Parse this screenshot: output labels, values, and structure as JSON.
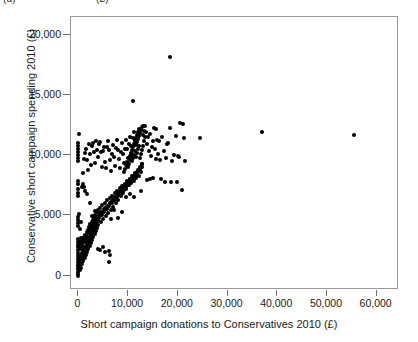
{
  "caption_fragment": {
    "part_a": "(a)",
    "part_b": "(£)"
  },
  "chart_data": {
    "type": "scatter",
    "title": "",
    "subtitle": "",
    "xlabel": "Short campaign donations to Conservatives 2010 (£)",
    "ylabel": "Conservative short campaign spending 2010 (£)",
    "xlim": [
      -1500,
      64500
    ],
    "ylim": [
      -1200,
      21500
    ],
    "xticks": [
      0,
      10000,
      20000,
      30000,
      40000,
      50000,
      60000
    ],
    "xticklabels": [
      "0",
      "10,000",
      "20,000",
      "30,000",
      "40,000",
      "50,000",
      "60,000"
    ],
    "yticks": [
      0,
      5000,
      10000,
      15000,
      20000
    ],
    "yticklabels": [
      "0",
      "5,000",
      "10,000",
      "15,000",
      "20,000"
    ],
    "grid": false,
    "legend": null,
    "marker": {
      "shape": "circle",
      "color": "#000000",
      "size_px": 4
    },
    "frame_color": "#9a9a9a",
    "n_points": 318,
    "points": [
      [
        0,
        0
      ],
      [
        0,
        120
      ],
      [
        0,
        330
      ],
      [
        0,
        520
      ],
      [
        0,
        700
      ],
      [
        0,
        900
      ],
      [
        0,
        1100
      ],
      [
        0,
        1350
      ],
      [
        0,
        1600
      ],
      [
        0,
        1850
      ],
      [
        0,
        2100
      ],
      [
        0,
        2350
      ],
      [
        0,
        2550
      ],
      [
        0,
        2800
      ],
      [
        0,
        3050
      ],
      [
        0,
        4100
      ],
      [
        0,
        4350
      ],
      [
        0,
        4600
      ],
      [
        0,
        4900
      ],
      [
        0,
        6650
      ],
      [
        0,
        6900
      ],
      [
        0,
        7200
      ],
      [
        0,
        7600
      ],
      [
        0,
        7900
      ],
      [
        0,
        9550
      ],
      [
        0,
        9800
      ],
      [
        0,
        10050
      ],
      [
        0,
        10300
      ],
      [
        0,
        10550
      ],
      [
        0,
        10800
      ],
      [
        0,
        11050
      ],
      [
        200,
        11750
      ],
      [
        150,
        2450
      ],
      [
        180,
        1250
      ],
      [
        220,
        620
      ],
      [
        250,
        2700
      ],
      [
        300,
        450
      ],
      [
        330,
        1500
      ],
      [
        360,
        900
      ],
      [
        400,
        2200
      ],
      [
        430,
        1750
      ],
      [
        460,
        3100
      ],
      [
        500,
        1000
      ],
      [
        530,
        2900
      ],
      [
        560,
        640
      ],
      [
        600,
        1400
      ],
      [
        640,
        2350
      ],
      [
        680,
        1850
      ],
      [
        720,
        980
      ],
      [
        760,
        2600
      ],
      [
        800,
        1500
      ],
      [
        840,
        3000
      ],
      [
        880,
        2050
      ],
      [
        920,
        1200
      ],
      [
        960,
        2750
      ],
      [
        1000,
        1600
      ],
      [
        1050,
        2400
      ],
      [
        1100,
        1850
      ],
      [
        1150,
        3200
      ],
      [
        1200,
        2250
      ],
      [
        1250,
        1450
      ],
      [
        1300,
        2800
      ],
      [
        1350,
        2000
      ],
      [
        1400,
        3350
      ],
      [
        1450,
        2500
      ],
      [
        1500,
        1700
      ],
      [
        1550,
        3050
      ],
      [
        1600,
        2300
      ],
      [
        1650,
        3600
      ],
      [
        1700,
        2700
      ],
      [
        1750,
        1950
      ],
      [
        1800,
        3250
      ],
      [
        1850,
        2550
      ],
      [
        1900,
        3800
      ],
      [
        1950,
        2900
      ],
      [
        2000,
        2200
      ],
      [
        2050,
        3500
      ],
      [
        2100,
        2750
      ],
      [
        2150,
        4050
      ],
      [
        2200,
        3150
      ],
      [
        2250,
        2450
      ],
      [
        2300,
        3700
      ],
      [
        2350,
        3000
      ],
      [
        2400,
        4250
      ],
      [
        2450,
        3400
      ],
      [
        2500,
        2700
      ],
      [
        2550,
        3900
      ],
      [
        2600,
        3250
      ],
      [
        2650,
        4450
      ],
      [
        2700,
        3600
      ],
      [
        2750,
        2950
      ],
      [
        2800,
        4100
      ],
      [
        2850,
        3500
      ],
      [
        2900,
        4650
      ],
      [
        2950,
        3850
      ],
      [
        3000,
        3200
      ],
      [
        3050,
        4300
      ],
      [
        3100,
        3750
      ],
      [
        3150,
        4850
      ],
      [
        3200,
        4100
      ],
      [
        3250,
        3450
      ],
      [
        3300,
        4500
      ],
      [
        3350,
        4000
      ],
      [
        3400,
        5050
      ],
      [
        3450,
        4350
      ],
      [
        3500,
        3700
      ],
      [
        3550,
        4700
      ],
      [
        3600,
        4250
      ],
      [
        3650,
        5250
      ],
      [
        3700,
        4600
      ],
      [
        3750,
        3950
      ],
      [
        3800,
        4900
      ],
      [
        3850,
        4500
      ],
      [
        3900,
        5450
      ],
      [
        3950,
        4850
      ],
      [
        4000,
        4200
      ],
      [
        4100,
        5100
      ],
      [
        4200,
        4750
      ],
      [
        4300,
        5650
      ],
      [
        4400,
        5050
      ],
      [
        4500,
        4450
      ],
      [
        4600,
        5300
      ],
      [
        4700,
        5000
      ],
      [
        4800,
        5850
      ],
      [
        4900,
        5300
      ],
      [
        5000,
        4700
      ],
      [
        5100,
        5500
      ],
      [
        5200,
        5250
      ],
      [
        5300,
        6050
      ],
      [
        5400,
        5550
      ],
      [
        5500,
        4950
      ],
      [
        5600,
        5700
      ],
      [
        5700,
        5500
      ],
      [
        5800,
        6250
      ],
      [
        5900,
        5800
      ],
      [
        6000,
        5200
      ],
      [
        6100,
        5900
      ],
      [
        6200,
        5750
      ],
      [
        6300,
        6450
      ],
      [
        6400,
        6050
      ],
      [
        6500,
        5450
      ],
      [
        6600,
        6100
      ],
      [
        6700,
        6000
      ],
      [
        6800,
        6650
      ],
      [
        6900,
        6300
      ],
      [
        7000,
        5700
      ],
      [
        7100,
        6300
      ],
      [
        7200,
        6250
      ],
      [
        7300,
        6850
      ],
      [
        7400,
        6550
      ],
      [
        7500,
        6000
      ],
      [
        7600,
        6500
      ],
      [
        7700,
        6500
      ],
      [
        7800,
        7050
      ],
      [
        7900,
        6800
      ],
      [
        8000,
        6300
      ],
      [
        8100,
        6700
      ],
      [
        8200,
        6750
      ],
      [
        8300,
        7250
      ],
      [
        8400,
        7050
      ],
      [
        8500,
        6600
      ],
      [
        8600,
        6900
      ],
      [
        8700,
        7000
      ],
      [
        8800,
        7450
      ],
      [
        8900,
        7300
      ],
      [
        9000,
        6900
      ],
      [
        9100,
        7100
      ],
      [
        9200,
        7250
      ],
      [
        9300,
        7650
      ],
      [
        9400,
        7550
      ],
      [
        9500,
        7200
      ],
      [
        9600,
        7300
      ],
      [
        9700,
        7500
      ],
      [
        9800,
        7850
      ],
      [
        9900,
        7800
      ],
      [
        10000,
        7500
      ],
      [
        10100,
        7500
      ],
      [
        10200,
        7750
      ],
      [
        10300,
        8050
      ],
      [
        10400,
        8050
      ],
      [
        10500,
        7800
      ],
      [
        10600,
        7700
      ],
      [
        10700,
        8000
      ],
      [
        10800,
        8250
      ],
      [
        10900,
        8300
      ],
      [
        11000,
        8100
      ],
      [
        11100,
        7900
      ],
      [
        11200,
        8250
      ],
      [
        11300,
        8450
      ],
      [
        11400,
        8550
      ],
      [
        11500,
        8400
      ],
      [
        11600,
        8100
      ],
      [
        11700,
        8500
      ],
      [
        11800,
        8650
      ],
      [
        11900,
        8800
      ],
      [
        12000,
        8700
      ],
      [
        12100,
        8300
      ],
      [
        12200,
        8750
      ],
      [
        12300,
        8850
      ],
      [
        12400,
        9050
      ],
      [
        12500,
        9000
      ],
      [
        12550,
        8600
      ],
      [
        12600,
        9000
      ],
      [
        12700,
        9050
      ],
      [
        12800,
        9250
      ],
      [
        12850,
        9300
      ],
      [
        9200,
        8600
      ],
      [
        9400,
        8900
      ],
      [
        9600,
        9200
      ],
      [
        9800,
        9450
      ],
      [
        10000,
        9000
      ],
      [
        10200,
        9300
      ],
      [
        10400,
        9600
      ],
      [
        10600,
        9900
      ],
      [
        10800,
        9500
      ],
      [
        11000,
        9750
      ],
      [
        11200,
        10050
      ],
      [
        11400,
        10350
      ],
      [
        11600,
        9900
      ],
      [
        11800,
        10200
      ],
      [
        12000,
        10500
      ],
      [
        12200,
        10750
      ],
      [
        11500,
        10850
      ],
      [
        11700,
        11100
      ],
      [
        11900,
        11350
      ],
      [
        12100,
        11600
      ],
      [
        12300,
        11850
      ],
      [
        12500,
        12100
      ],
      [
        12700,
        12350
      ],
      [
        12900,
        12450
      ],
      [
        12200,
        12200
      ],
      [
        12000,
        11950
      ],
      [
        11800,
        11700
      ],
      [
        11600,
        11450
      ],
      [
        11400,
        11200
      ],
      [
        11200,
        10950
      ],
      [
        11000,
        10700
      ],
      [
        10800,
        10450
      ],
      [
        10600,
        10200
      ],
      [
        10400,
        9950
      ],
      [
        12400,
        9750
      ],
      [
        12600,
        10100
      ],
      [
        12800,
        10450
      ],
      [
        13000,
        10800
      ],
      [
        13200,
        11150
      ],
      [
        13400,
        11500
      ],
      [
        13100,
        12050
      ],
      [
        13300,
        12400
      ],
      [
        12900,
        11700
      ],
      [
        1000,
        8550
      ],
      [
        1100,
        9700
      ],
      [
        1300,
        10200
      ],
      [
        1500,
        10500
      ],
      [
        1700,
        9650
      ],
      [
        1900,
        8750
      ],
      [
        2100,
        10900
      ],
      [
        2300,
        10150
      ],
      [
        2500,
        9200
      ],
      [
        2700,
        10750
      ],
      [
        2900,
        11050
      ],
      [
        3100,
        10250
      ],
      [
        3300,
        9350
      ],
      [
        3500,
        11150
      ],
      [
        3700,
        10450
      ],
      [
        3900,
        9900
      ],
      [
        4100,
        10900
      ],
      [
        4300,
        11100
      ],
      [
        4500,
        10250
      ],
      [
        4700,
        9050
      ],
      [
        4900,
        10350
      ],
      [
        5100,
        10650
      ],
      [
        5300,
        9450
      ],
      [
        5500,
        8950
      ],
      [
        5700,
        10700
      ],
      [
        5900,
        11200
      ],
      [
        6100,
        10400
      ],
      [
        6300,
        9600
      ],
      [
        6500,
        8700
      ],
      [
        6700,
        10150
      ],
      [
        6900,
        10850
      ],
      [
        7100,
        9900
      ],
      [
        7300,
        9150
      ],
      [
        7500,
        10600
      ],
      [
        7700,
        11250
      ],
      [
        7900,
        10450
      ],
      [
        8100,
        9700
      ],
      [
        8300,
        8950
      ],
      [
        8500,
        10250
      ],
      [
        8700,
        11000
      ],
      [
        8900,
        10150
      ],
      [
        9100,
        9400
      ],
      [
        9300,
        10550
      ],
      [
        9500,
        11300
      ],
      [
        9700,
        10500
      ],
      [
        9900,
        9750
      ],
      [
        10100,
        10950
      ],
      [
        10300,
        11550
      ],
      [
        10500,
        10800
      ],
      [
        10700,
        10100
      ],
      [
        10900,
        11400
      ],
      [
        11100,
        11950
      ],
      [
        11300,
        11250
      ],
      [
        13600,
        11900
      ],
      [
        13800,
        10900
      ],
      [
        14000,
        11500
      ],
      [
        14200,
        10350
      ],
      [
        14400,
        11750
      ],
      [
        14600,
        9950
      ],
      [
        14800,
        10700
      ],
      [
        15000,
        11150
      ],
      [
        15200,
        12250
      ],
      [
        15400,
        10500
      ],
      [
        15600,
        9700
      ],
      [
        15800,
        11300
      ],
      [
        16000,
        10150
      ],
      [
        16400,
        9600
      ],
      [
        16800,
        11550
      ],
      [
        17200,
        10350
      ],
      [
        17600,
        9750
      ],
      [
        18000,
        11050
      ],
      [
        18400,
        12300
      ],
      [
        18800,
        9500
      ],
      [
        19200,
        10000
      ],
      [
        19600,
        11600
      ],
      [
        20000,
        9950
      ],
      [
        20400,
        12650
      ],
      [
        20800,
        7150
      ],
      [
        21200,
        11450
      ],
      [
        19800,
        7750
      ],
      [
        18600,
        7800
      ],
      [
        17400,
        7750
      ],
      [
        16600,
        8050
      ],
      [
        15100,
        8150
      ],
      [
        14300,
        8000
      ],
      [
        13700,
        7950
      ],
      [
        12600,
        7000
      ],
      [
        11200,
        6500
      ],
      [
        10300,
        6800
      ],
      [
        9600,
        6500
      ],
      [
        8800,
        5300
      ],
      [
        8000,
        4750
      ],
      [
        7200,
        5450
      ],
      [
        6600,
        4700
      ],
      [
        6200,
        1150
      ],
      [
        6400,
        1700
      ],
      [
        6100,
        2050
      ],
      [
        5400,
        2000
      ],
      [
        4900,
        2350
      ],
      [
        4400,
        2100
      ],
      [
        3900,
        2250
      ],
      [
        3400,
        5350
      ],
      [
        2800,
        4950
      ],
      [
        2300,
        6050
      ],
      [
        1800,
        6800
      ],
      [
        1400,
        7050
      ],
      [
        1200,
        7350
      ],
      [
        900,
        7600
      ],
      [
        700,
        7350
      ],
      [
        500,
        4450
      ],
      [
        300,
        3900
      ],
      [
        150,
        5150
      ],
      [
        11000,
        14500
      ],
      [
        18500,
        18200
      ],
      [
        24500,
        11400
      ],
      [
        37000,
        11900
      ],
      [
        55500,
        11700
      ],
      [
        21000,
        12600
      ],
      [
        20300,
        9900
      ],
      [
        17900,
        10900
      ],
      [
        16200,
        11150
      ],
      [
        15700,
        12200
      ],
      [
        21500,
        9500
      ]
    ],
    "annotations": []
  }
}
